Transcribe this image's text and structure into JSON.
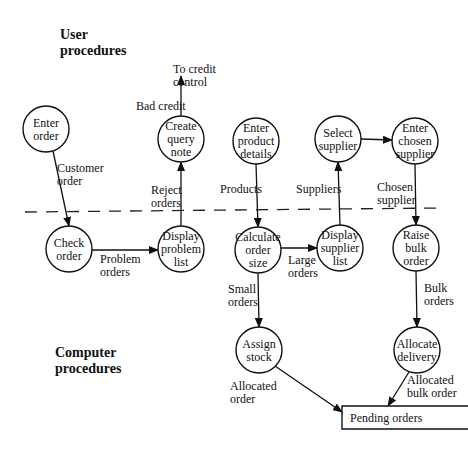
{
  "sections": [
    {
      "id": "user",
      "lines": [
        "User",
        "procedures"
      ],
      "x": 60,
      "y": 39
    },
    {
      "id": "computer",
      "lines": [
        "Computer",
        "procedures"
      ],
      "x": 55,
      "y": 357
    }
  ],
  "divider": {
    "x1": 25,
    "y1": 212,
    "x2": 440,
    "y2": 208,
    "dash": "12 9"
  },
  "nodes": [
    {
      "id": "enter-order",
      "lines": [
        "Enter",
        "order"
      ],
      "cx": 46,
      "cy": 129,
      "r": 23
    },
    {
      "id": "create-query-note",
      "lines": [
        "Create",
        "query",
        "note"
      ],
      "cx": 181,
      "cy": 139,
      "r": 23
    },
    {
      "id": "enter-product-details",
      "lines": [
        "Enter",
        "product",
        "details"
      ],
      "cx": 256,
      "cy": 141,
      "r": 23
    },
    {
      "id": "select-supplier",
      "lines": [
        "Select",
        "supplier"
      ],
      "cx": 338,
      "cy": 139,
      "r": 23
    },
    {
      "id": "enter-chosen-supplier",
      "lines": [
        "Enter",
        "chosen",
        "supplier"
      ],
      "cx": 415,
      "cy": 141,
      "r": 23
    },
    {
      "id": "check-order",
      "lines": [
        "Check",
        "order"
      ],
      "cx": 69,
      "cy": 249,
      "r": 23
    },
    {
      "id": "display-problem-list",
      "lines": [
        "Display",
        "problem",
        "list"
      ],
      "cx": 181,
      "cy": 249,
      "r": 23
    },
    {
      "id": "calculate-order-size",
      "lines": [
        "Calculate",
        "order",
        "size"
      ],
      "cx": 258,
      "cy": 250,
      "r": 23
    },
    {
      "id": "display-supplier-list",
      "lines": [
        "Display",
        "supplier",
        "list"
      ],
      "cx": 340,
      "cy": 248,
      "r": 23
    },
    {
      "id": "raise-bulk-order",
      "lines": [
        "Raise",
        "bulk",
        "order"
      ],
      "cx": 416,
      "cy": 248,
      "r": 23
    },
    {
      "id": "assign-stock",
      "lines": [
        "Assign",
        "stock"
      ],
      "cx": 259,
      "cy": 350,
      "r": 23
    },
    {
      "id": "allocate-delivery",
      "lines": [
        "Allocate",
        "delivery"
      ],
      "cx": 417,
      "cy": 350,
      "r": 23
    }
  ],
  "store": {
    "id": "pending-orders",
    "label": "Pending orders",
    "x": 342,
    "y": 406,
    "w": 126,
    "h": 23
  },
  "flows": [
    {
      "id": "bad-credit",
      "x1": 181,
      "y1": 116,
      "x2": 181,
      "y2": 76,
      "lines": [
        "Bad credit"
      ],
      "lx": 136,
      "ly": 110
    },
    {
      "id": "to-credit-control",
      "x1": 0,
      "y1": 0,
      "x2": 0,
      "y2": 0,
      "lines": [
        "To credit",
        "control"
      ],
      "lx": 173,
      "ly": 73,
      "no_line": true
    },
    {
      "id": "customer-order",
      "x1": 53,
      "y1": 151,
      "x2": 69,
      "y2": 226,
      "lines": [
        "Customer",
        "order"
      ],
      "lx": 57,
      "ly": 172
    },
    {
      "id": "reject-orders",
      "x1": 181,
      "y1": 226,
      "x2": 181,
      "y2": 162,
      "lines": [
        "Reject",
        "orders"
      ],
      "lx": 151,
      "ly": 194
    },
    {
      "id": "products",
      "x1": 256,
      "y1": 164,
      "x2": 258,
      "y2": 227,
      "lines": [
        "Products"
      ],
      "lx": 220,
      "ly": 193
    },
    {
      "id": "suppliers",
      "x1": 340,
      "y1": 225,
      "x2": 338,
      "y2": 162,
      "lines": [
        "Suppliers"
      ],
      "lx": 296,
      "ly": 193
    },
    {
      "id": "chosen-supplier-flow",
      "x1": 415,
      "y1": 164,
      "x2": 416,
      "y2": 225,
      "lines": [
        "Chosen",
        "supplier"
      ],
      "lx": 377,
      "ly": 191
    },
    {
      "id": "selected-supplier-flow",
      "x1": 361,
      "y1": 139,
      "x2": 392,
      "y2": 140,
      "lines": [],
      "lx": 0,
      "ly": 0
    },
    {
      "id": "problem-orders",
      "x1": 92,
      "y1": 250,
      "x2": 158,
      "y2": 250,
      "lines": [
        "Problem",
        "orders"
      ],
      "lx": 100,
      "ly": 263
    },
    {
      "id": "large-orders",
      "x1": 281,
      "y1": 248,
      "x2": 317,
      "y2": 248,
      "lines": [
        "Large",
        "orders"
      ],
      "lx": 288,
      "ly": 264
    },
    {
      "id": "small-orders",
      "x1": 258,
      "y1": 273,
      "x2": 259,
      "y2": 327,
      "lines": [
        "Small",
        "orders"
      ],
      "lx": 228,
      "ly": 293
    },
    {
      "id": "bulk-orders",
      "x1": 416,
      "y1": 271,
      "x2": 417,
      "y2": 327,
      "lines": [
        "Bulk",
        "orders"
      ],
      "lx": 424,
      "ly": 292
    },
    {
      "id": "allocated-order",
      "x1": 275,
      "y1": 366,
      "x2": 342,
      "y2": 412,
      "lines": [
        "Allocated",
        "order"
      ],
      "lx": 230,
      "ly": 390
    },
    {
      "id": "allocated-bulk-order",
      "x1": 409,
      "y1": 372,
      "x2": 388,
      "y2": 406,
      "lines": [
        "Allocated",
        "bulk order"
      ],
      "lx": 407,
      "ly": 384
    }
  ]
}
